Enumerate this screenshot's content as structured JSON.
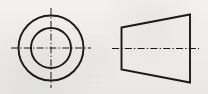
{
  "sheet": {
    "title": "Two-view orthographic engineering drawing",
    "width": 208,
    "height": 94,
    "background_color": "#f2f1ef",
    "line_color": "#1a1a1a",
    "centerline_color": "#1a1a1a",
    "outline_stroke_width": 1.9,
    "centerline_stroke_width": 1.0,
    "centerline_dash_pattern": "7 2.2 1.4 2.2"
  },
  "views": [
    {
      "name": "front-view",
      "label": "Front view (circular)",
      "type": "concentric-circles",
      "center": {
        "x": 51,
        "y": 48
      },
      "circles": [
        {
          "name": "outer-circle",
          "radius": 32.5
        },
        {
          "name": "inner-circle",
          "radius": 20.0
        }
      ],
      "centerlines": [
        {
          "name": "horizontal-centerline",
          "orientation": "horizontal",
          "x1": 11,
          "y1": 48,
          "x2": 91,
          "y2": 48
        },
        {
          "name": "vertical-centerline",
          "orientation": "vertical",
          "x1": 51,
          "y1": 8,
          "x2": 51,
          "y2": 88
        }
      ]
    },
    {
      "name": "side-view",
      "label": "Side view (truncated cone / trapezoid)",
      "type": "trapezoid",
      "vertices": [
        {
          "name": "top-left",
          "x": 121.5,
          "y": 27.5
        },
        {
          "name": "top-right",
          "x": 190.0,
          "y": 14.5
        },
        {
          "name": "bottom-right",
          "x": 190.0,
          "y": 82.5
        },
        {
          "name": "bottom-left",
          "x": 121.5,
          "y": 69.5
        }
      ],
      "edges": [
        {
          "name": "left-edge",
          "kind": "vertical"
        },
        {
          "name": "top-edge",
          "kind": "slanted"
        },
        {
          "name": "right-edge",
          "kind": "vertical"
        },
        {
          "name": "bottom-edge",
          "kind": "slanted"
        }
      ],
      "centerlines": [
        {
          "name": "axis-centerline",
          "orientation": "horizontal",
          "x1": 112,
          "y1": 48.5,
          "x2": 199,
          "y2": 48.5
        }
      ]
    }
  ]
}
